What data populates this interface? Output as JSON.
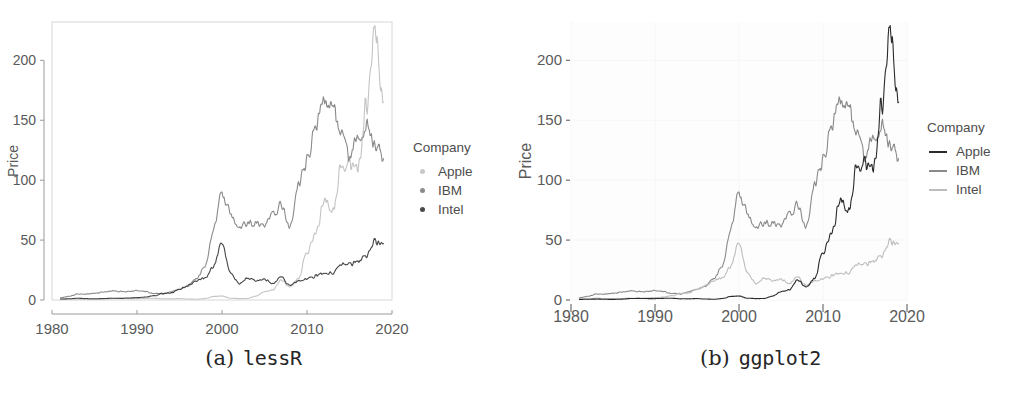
{
  "figure": {
    "panels": [
      {
        "id": "lessr",
        "caption_label": "(a)",
        "caption_name": "lessR",
        "style": "lessR",
        "axis": {
          "ylabel": "Price",
          "xlabel": "",
          "yticks": [
            0,
            50,
            100,
            150,
            200
          ],
          "xticks": [
            1980,
            1990,
            2000,
            2010,
            2020
          ],
          "ytick_labels": [
            "0",
            "50",
            "100",
            "150",
            "200"
          ],
          "xtick_labels": [
            "1980",
            "1990",
            "2000",
            "2010",
            "2020"
          ],
          "xlim": [
            1980,
            2020
          ],
          "ylim": [
            0,
            232
          ],
          "panel_border": true,
          "grid": false,
          "panel_bg": "#ffffff",
          "border_color": "#d8d8d8",
          "axis_line_color": "#9a9a9a"
        },
        "legend": {
          "title": "Company",
          "key_type": "dot",
          "entries": [
            {
              "label": "Apple",
              "color": "#c8c8c8"
            },
            {
              "label": "IBM",
              "color": "#8c8c8c"
            },
            {
              "label": "Intel",
              "color": "#4a4a4a"
            }
          ]
        },
        "series_colors": {
          "Apple": "#c4c4c4",
          "IBM": "#8a8a8a",
          "Intel": "#454545"
        }
      },
      {
        "id": "ggplot2",
        "caption_label": "(b)",
        "caption_name": "ggplot2",
        "style": "ggplot2",
        "axis": {
          "ylabel": "Price",
          "xlabel": "",
          "yticks": [
            0,
            50,
            100,
            150,
            200
          ],
          "xticks": [
            1980,
            1990,
            2000,
            2010,
            2020
          ],
          "ytick_labels": [
            "0",
            "50",
            "100",
            "150",
            "200"
          ],
          "xtick_labels": [
            "1980",
            "1990",
            "2000",
            "2010",
            "2020"
          ],
          "xlim": [
            1980,
            2020
          ],
          "ylim": [
            0,
            232
          ],
          "panel_border": false,
          "grid": true,
          "panel_bg": "#fdfdfd",
          "grid_color": "#f6f6f6",
          "tick_color": "#6f6f6f"
        },
        "legend": {
          "title": "Company",
          "key_type": "line",
          "entries": [
            {
              "label": "Apple",
              "color": "#2b2b2b"
            },
            {
              "label": "IBM",
              "color": "#8a8a8a"
            },
            {
              "label": "Intel",
              "color": "#bdbdbd"
            }
          ]
        },
        "series_colors": {
          "Apple": "#2b2b2b",
          "IBM": "#8a8a8a",
          "Intel": "#bdbdbd"
        }
      }
    ]
  },
  "chart_data": {
    "type": "line",
    "title": "",
    "xlabel": "",
    "ylabel": "Price",
    "xlim": [
      1980,
      2020
    ],
    "ylim": [
      0,
      232
    ],
    "xticks": [
      1980,
      1990,
      2000,
      2010,
      2020
    ],
    "yticks": [
      0,
      50,
      100,
      150,
      200
    ],
    "grid": false,
    "legend_position": "right",
    "legend_title": "Company",
    "x_description": "Year (monthly stock closing price series, 1981-2019)",
    "x": [
      1981,
      1982,
      1983,
      1984,
      1985,
      1986,
      1987,
      1988,
      1989,
      1990,
      1991,
      1992,
      1993,
      1994,
      1995,
      1996,
      1997,
      1998,
      1999,
      2000,
      2001,
      2002,
      2003,
      2004,
      2005,
      2006,
      2007,
      2008,
      2009,
      2010,
      2011,
      2012,
      2013,
      2014,
      2015,
      2016,
      2017,
      2018,
      2019
    ],
    "series": [
      {
        "name": "Apple",
        "values": [
          0.5,
          0.6,
          0.8,
          0.6,
          0.5,
          0.7,
          1.2,
          1.3,
          1.2,
          1.1,
          1.4,
          1.5,
          1.0,
          1.0,
          1.2,
          0.8,
          0.6,
          1.2,
          3.0,
          3.3,
          1.5,
          1.2,
          1.3,
          3.2,
          7.0,
          8.5,
          17.0,
          11.0,
          18.0,
          40.0,
          55.0,
          85.0,
          72.0,
          110.0,
          115.0,
          110.0,
          165.0,
          225.0,
          165.0
        ]
      },
      {
        "name": "IBM",
        "values": [
          2.0,
          3.0,
          5.0,
          5.0,
          5.5,
          6.5,
          7.5,
          7.0,
          7.0,
          8.0,
          7.0,
          5.5,
          5.0,
          7.0,
          9.0,
          12.0,
          18.0,
          28.0,
          60.0,
          88.0,
          72.0,
          58.0,
          65.0,
          63.0,
          62.0,
          72.0,
          80.0,
          60.0,
          95.0,
          115.0,
          145.0,
          170.0,
          160.0,
          140.0,
          120.0,
          135.0,
          145.0,
          130.0,
          118.0
        ]
      },
      {
        "name": "Intel",
        "values": [
          0.8,
          1.0,
          1.5,
          1.2,
          1.0,
          1.2,
          1.5,
          1.4,
          1.6,
          2.0,
          2.5,
          3.5,
          5.5,
          6.0,
          9.0,
          12.0,
          16.0,
          18.0,
          28.0,
          48.0,
          22.0,
          14.0,
          18.0,
          16.0,
          17.0,
          14.0,
          19.0,
          12.0,
          16.0,
          18.0,
          20.0,
          23.0,
          22.0,
          30.0,
          30.0,
          32.0,
          37.0,
          48.0,
          47.0
        ]
      }
    ],
    "notes": [
      "Apple peaks near 230 in 2018 then falls to ~165",
      "IBM peaks near 170 in 2012-2013",
      "Intel peaks near 48 in 2000 and again near 2018"
    ]
  }
}
